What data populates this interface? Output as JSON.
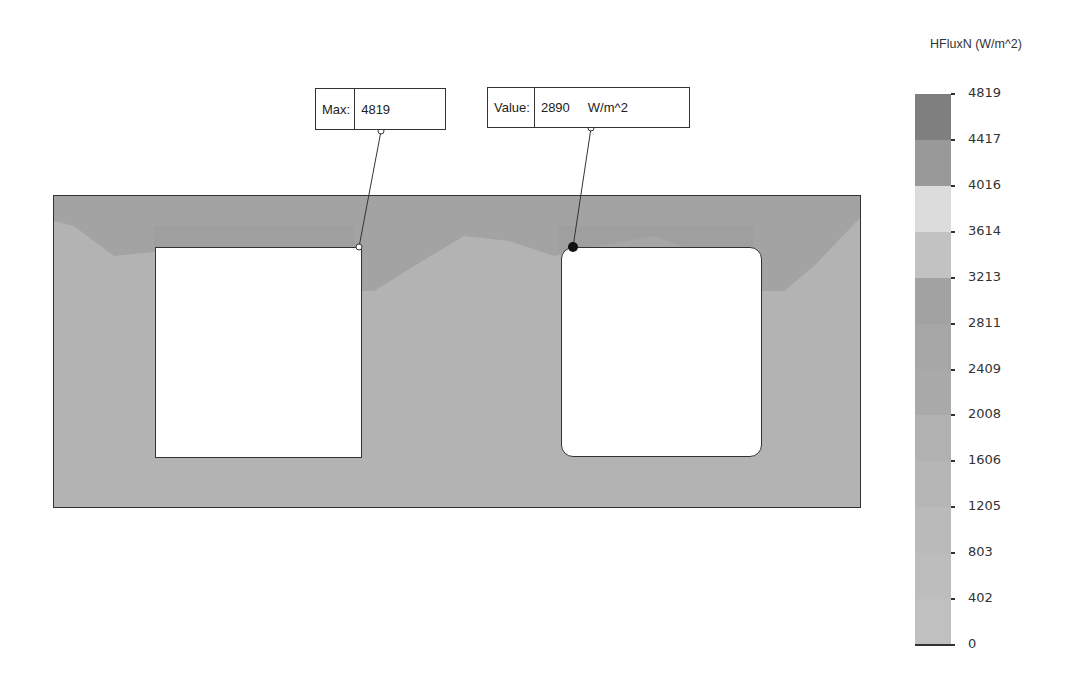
{
  "legend": {
    "title": "HFluxN (W/m^2)",
    "ticks": [
      "4819",
      "4417",
      "4016",
      "3614",
      "3213",
      "2811",
      "2409",
      "2008",
      "1606",
      "1205",
      "803",
      "402",
      "0"
    ],
    "segment_colors": [
      "#7f7f7f",
      "#999999",
      "#dcdcdc",
      "#c2c2c2",
      "#a2a2a2",
      "#a6a6a6",
      "#a9a9a9",
      "#b1b1b1",
      "#b6b6b6",
      "#bababa",
      "#bdbdbd",
      "#c0c0c0"
    ]
  },
  "callouts": {
    "max": {
      "label": "Max:",
      "value": "4819"
    },
    "probe": {
      "label": "Value:",
      "value": "2890",
      "unit": "W/m^2"
    }
  },
  "colors": {
    "plate": "#b3b3b3",
    "hotspot": "#9e9e9e",
    "outline": "#333333"
  }
}
